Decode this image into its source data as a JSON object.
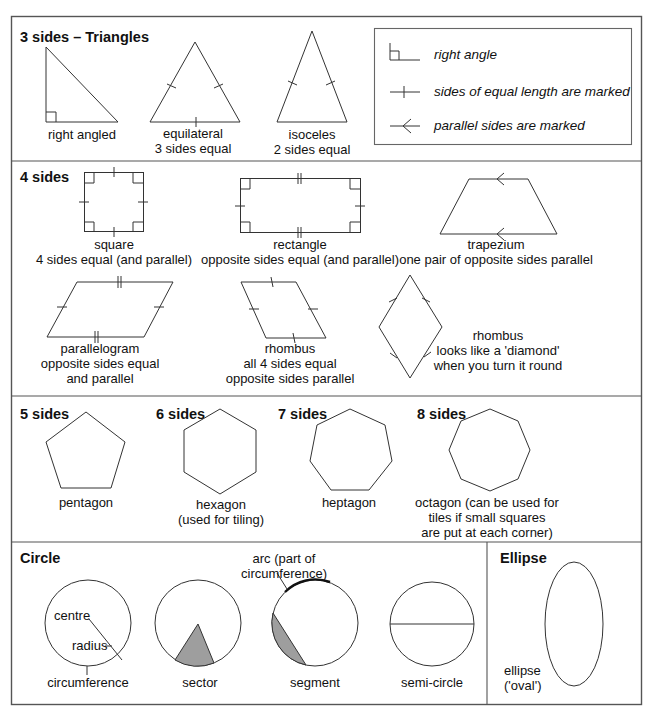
{
  "sections": {
    "triangles": {
      "heading": "3 sides – Triangles",
      "items": [
        {
          "name": "right angled",
          "lines": [
            "right angled"
          ]
        },
        {
          "name": "equilateral",
          "lines": [
            "equilateral",
            "3 sides equal"
          ]
        },
        {
          "name": "isoceles",
          "lines": [
            "isoceles",
            "2 sides equal"
          ]
        }
      ]
    },
    "legend": {
      "items": [
        {
          "icon": "right-angle-icon",
          "label": "right angle"
        },
        {
          "icon": "equal-length-tick-icon",
          "label": "sides of equal length are marked"
        },
        {
          "icon": "parallel-arrow-icon",
          "label": "parallel sides are marked"
        }
      ]
    },
    "four_sides": {
      "heading": "4 sides",
      "items": [
        {
          "name": "square",
          "lines": [
            "square",
            "4 sides equal (and parallel)"
          ]
        },
        {
          "name": "rectangle",
          "lines": [
            "rectangle",
            "opposite sides equal (and parallel)"
          ]
        },
        {
          "name": "trapezium",
          "lines": [
            "trapezium",
            "one pair of opposite sides parallel"
          ]
        },
        {
          "name": "parallelogram",
          "lines": [
            "parallelogram",
            "opposite sides equal",
            "and parallel"
          ]
        },
        {
          "name": "rhombus",
          "lines": [
            "rhombus",
            "all 4 sides equal",
            "opposite sides parallel"
          ]
        },
        {
          "name": "rhombus-diamond",
          "lines": [
            "rhombus",
            "looks like a 'diamond'",
            "when you turn it round"
          ]
        }
      ]
    },
    "polygons": {
      "items": [
        {
          "heading": "5 sides",
          "lines": [
            "pentagon"
          ]
        },
        {
          "heading": "6 sides",
          "lines": [
            "hexagon",
            "(used for tiling)"
          ]
        },
        {
          "heading": "7 sides",
          "lines": [
            "heptagon"
          ]
        },
        {
          "heading": "8 sides",
          "lines": [
            "octagon (can be used for",
            "tiles if small squares",
            "are put at each corner)"
          ]
        }
      ]
    },
    "circle": {
      "heading": "Circle",
      "labels": {
        "centre": "centre",
        "radius": "radius",
        "circumference": "circumference",
        "sector": "sector",
        "arc_line1": "arc (part of",
        "arc_line2": "circumference)",
        "segment": "segment",
        "semicircle": "semi-circle"
      }
    },
    "ellipse": {
      "heading": "Ellipse",
      "lines": [
        "ellipse",
        "('oval')"
      ]
    }
  },
  "colors": {
    "line": "#333333",
    "frame": "#555555",
    "shade": "#9e9e9e",
    "background": "#ffffff"
  }
}
